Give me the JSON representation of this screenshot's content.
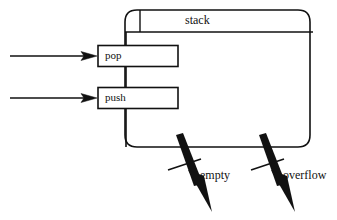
{
  "diagram": {
    "title": "stack",
    "component": {
      "name": "stack",
      "label": "stack"
    },
    "ports": [
      {
        "id": "pop",
        "label": "pop",
        "kind": "input-port",
        "arrow": "incoming"
      },
      {
        "id": "push",
        "label": "push",
        "kind": "input-port",
        "arrow": "incoming"
      }
    ],
    "exceptions": [
      {
        "id": "empty",
        "label": "empty",
        "kind": "exception-arrow"
      },
      {
        "id": "overflow",
        "label": "overflow",
        "kind": "exception-arrow"
      }
    ],
    "colors": {
      "stroke": "#111111",
      "fill": "#ffffff",
      "background": "#ffffff",
      "text": "#111111"
    }
  }
}
